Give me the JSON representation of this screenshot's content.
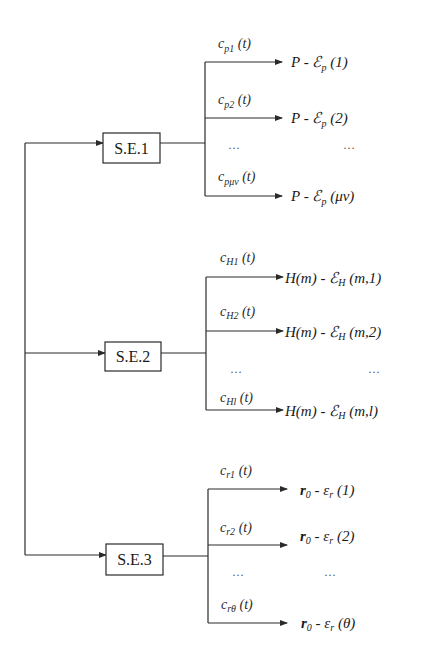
{
  "diagram": {
    "groups": [
      {
        "box_label": "S.E.1",
        "branches": [
          {
            "label": "c_p1 (t)",
            "label_main": "c",
            "label_sub": "p1",
            "label_suffix": " (t)",
            "output": "P - ℰ_p (1)",
            "out_main": "P - ℰ",
            "out_sub": "p",
            "out_suffix": " (1)"
          },
          {
            "label": "c_p2 (t)",
            "label_main": "c",
            "label_sub": "p2",
            "label_suffix": " (t)",
            "output": "P - ℰ_p (2)",
            "out_main": "P - ℰ",
            "out_sub": "p",
            "out_suffix": " (2)"
          },
          {
            "label": "c_pμν (t)",
            "label_main": "c",
            "label_sub": "pμν",
            "label_suffix": " (t)",
            "output": "P - ℰ_p (μν)",
            "out_main": "P - ℰ",
            "out_sub": "p",
            "out_suffix": " (μν)"
          }
        ],
        "ellipsis_left": "…",
        "ellipsis_right": "…"
      },
      {
        "box_label": "S.E.2",
        "branches": [
          {
            "label": "c_H1 (t)",
            "label_main": "c",
            "label_sub": "H1",
            "label_suffix": " (t)",
            "output": "H(m) - ℰ_H (m,1)",
            "out_main": "H(m) - ℰ",
            "out_sub": "H",
            "out_suffix": " (m,1)"
          },
          {
            "label": "c_H2 (t)",
            "label_main": "c",
            "label_sub": "H2",
            "label_suffix": " (t)",
            "output": "H(m) - ℰ_H (m,2)",
            "out_main": "H(m) - ℰ",
            "out_sub": "H",
            "out_suffix": " (m,2)"
          },
          {
            "label": "c_Hl (t)",
            "label_main": "c",
            "label_sub": "Hl",
            "label_suffix": " (t)",
            "output": "H(m) - ℰ_H (m,l)",
            "out_main": "H(m) - ℰ",
            "out_sub": "H",
            "out_suffix": " (m,l)"
          }
        ],
        "ellipsis_left": "…",
        "ellipsis_right": "…"
      },
      {
        "box_label": "S.E.3",
        "branches": [
          {
            "label": "c_r1 (t)",
            "label_main": "c",
            "label_sub": "r1",
            "label_suffix": " (t)",
            "output": "r_0 - ε_r (1)",
            "out_main": "r",
            "out_sub0": "0",
            "out_mid": " - ε",
            "out_sub": "r",
            "out_suffix": " (1)"
          },
          {
            "label": "c_r2 (t)",
            "label_main": "c",
            "label_sub": "r2",
            "label_suffix": " (t)",
            "output": "r_0 - ε_r (2)",
            "out_main": "r",
            "out_sub0": "0",
            "out_mid": " - ε",
            "out_sub": "r",
            "out_suffix": " (2)"
          },
          {
            "label": "c_rθ (t)",
            "label_main": "c",
            "label_sub": "rθ",
            "label_suffix": " (t)",
            "output": "r_0 - ε_r (θ)",
            "out_main": "r",
            "out_sub0": "0",
            "out_mid": " - ε",
            "out_sub": "r",
            "out_suffix": " (θ)"
          }
        ],
        "ellipsis_left": "…",
        "ellipsis_right": "…"
      }
    ],
    "colors": {
      "line": "#2a2a2a",
      "background": "#ffffff"
    }
  }
}
